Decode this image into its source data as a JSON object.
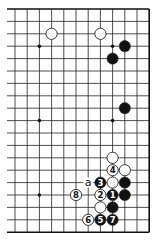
{
  "diagram": {
    "type": "go-board-fragment",
    "caption": "",
    "grid": {
      "columns": 12,
      "rows": 19,
      "origin_x": 15,
      "origin_y": 9,
      "spacing_x": 12.2,
      "spacing_y": 12.4,
      "left_edge_open": true,
      "line_color": "#222222",
      "edge_color": "#111111"
    },
    "star_points": [
      {
        "col": 2,
        "row": 3
      },
      {
        "col": 8,
        "row": 3
      },
      {
        "col": 2,
        "row": 9
      },
      {
        "col": 8,
        "row": 9
      },
      {
        "col": 2,
        "row": 15
      }
    ],
    "stones": [
      {
        "col": 3,
        "row": 2,
        "color": "white",
        "label": ""
      },
      {
        "col": 7,
        "row": 2,
        "color": "white",
        "label": ""
      },
      {
        "col": 9,
        "row": 3,
        "color": "black",
        "label": ""
      },
      {
        "col": 8,
        "row": 4,
        "color": "black",
        "label": ""
      },
      {
        "col": 9,
        "row": 8,
        "color": "black",
        "label": ""
      },
      {
        "col": 8,
        "row": 12,
        "color": "white",
        "label": ""
      },
      {
        "col": 8,
        "row": 13,
        "color": "white",
        "label": "4"
      },
      {
        "col": 9,
        "row": 13,
        "color": "white",
        "label": ""
      },
      {
        "col": 7,
        "row": 14,
        "color": "black",
        "label": "3"
      },
      {
        "col": 8,
        "row": 14,
        "color": "white",
        "label": ""
      },
      {
        "col": 9,
        "row": 14,
        "color": "black",
        "label": ""
      },
      {
        "col": 5,
        "row": 15,
        "color": "white",
        "label": "8"
      },
      {
        "col": 7,
        "row": 15,
        "color": "white",
        "label": "2"
      },
      {
        "col": 8,
        "row": 15,
        "color": "black",
        "label": "1"
      },
      {
        "col": 9,
        "row": 15,
        "color": "black",
        "label": ""
      },
      {
        "col": 7,
        "row": 16,
        "color": "white",
        "label": ""
      },
      {
        "col": 8,
        "row": 16,
        "color": "black",
        "label": ""
      },
      {
        "col": 6,
        "row": 17,
        "color": "white",
        "label": "6"
      },
      {
        "col": 7,
        "row": 17,
        "color": "black",
        "label": "5"
      },
      {
        "col": 8,
        "row": 17,
        "color": "black",
        "label": "7"
      }
    ],
    "markers": [
      {
        "col": 6,
        "row": 14,
        "text": "a"
      }
    ],
    "colors": {
      "black_stone": "#111111",
      "white_stone": "#ffffff",
      "stone_outline": "#222222",
      "label_on_black": "#ffffff",
      "label_on_white": "#111111"
    }
  }
}
